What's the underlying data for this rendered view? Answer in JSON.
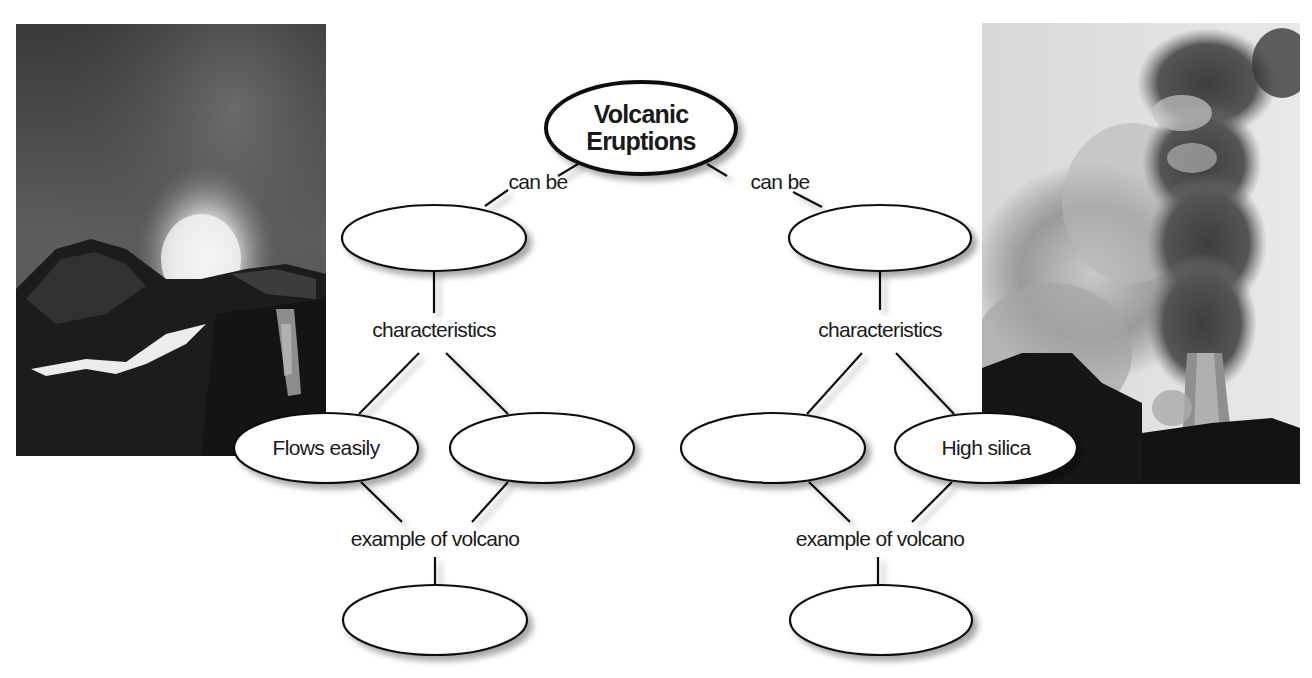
{
  "colors": {
    "line": "#111111",
    "node_fill": "#ffffff",
    "shadow": "#bdbdbd",
    "background": "#ffffff"
  },
  "root": {
    "label_line1": "Volcanic",
    "label_line2": "Eruptions"
  },
  "branches": [
    {
      "side": "left",
      "link_label": "can be",
      "type_node": {
        "label": ""
      },
      "characteristics_label": "characteristics",
      "characteristics": [
        {
          "label": "Flows easily"
        },
        {
          "label": ""
        }
      ],
      "example_label": "example of volcano",
      "example_node": {
        "label": ""
      }
    },
    {
      "side": "right",
      "link_label": "can be",
      "type_node": {
        "label": ""
      },
      "characteristics_label": "characteristics",
      "characteristics": [
        {
          "label": ""
        },
        {
          "label": "High silica"
        }
      ],
      "example_label": "example of volcano",
      "example_node": {
        "label": ""
      }
    }
  ],
  "images": [
    {
      "name": "quiet-eruption-photo",
      "description": "lava fountain and glowing lava flows at night"
    },
    {
      "name": "explosive-eruption-photo",
      "description": "towering ash and steam plume"
    }
  ]
}
